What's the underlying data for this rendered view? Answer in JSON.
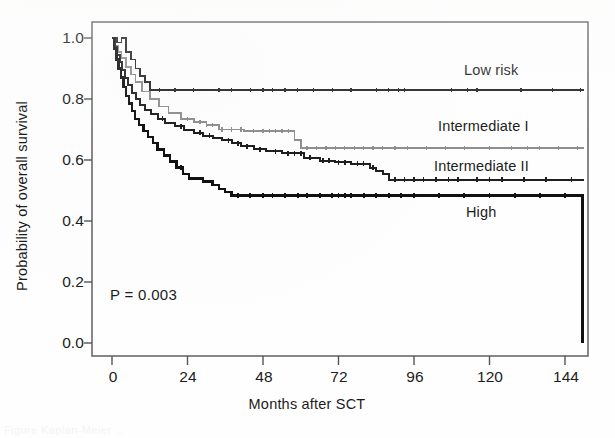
{
  "figure": {
    "kind": "kaplan-meier-survival-plot",
    "caption_remnant": "Figure  Kaplan-Meier ..."
  },
  "axes": {
    "y_title": "Probability of overall survival",
    "x_title": "Months after SCT",
    "y_ticks": [
      "0.0",
      "0.2",
      "0.4",
      "0.6",
      "0.8",
      "1.0"
    ],
    "x_ticks": [
      "0",
      "24",
      "48",
      "72",
      "96",
      "120",
      "144"
    ]
  },
  "annotations": {
    "pvalue": "P = 0.003"
  },
  "curve_labels": {
    "low": "Low risk",
    "intermediate_1": "Intermediate I",
    "intermediate_2": "Intermediate II",
    "high": "High"
  },
  "colors": {
    "low_risk": "#262626",
    "intermediate_1": "#8f8f8f",
    "intermediate_2": "#1f1f1f",
    "high": "#111111",
    "frame": "#555555",
    "text": "#1c1c1c",
    "background": "#fefefe"
  },
  "chart_data": {
    "type": "line",
    "plot_kind": "kaplan-meier step survival curves",
    "title": "",
    "xlabel": "Months after SCT",
    "ylabel": "Probability of overall survival",
    "xlim": [
      -4,
      152
    ],
    "ylim": [
      0.0,
      1.04
    ],
    "xticks": [
      0,
      24,
      48,
      72,
      96,
      120,
      144
    ],
    "yticks": [
      0.0,
      0.2,
      0.4,
      0.6,
      0.8,
      1.0
    ],
    "grid": false,
    "legend": "inline labels at right end of each curve",
    "annotations": [
      {
        "text": "P = 0.003",
        "x": 6,
        "y": 0.19
      }
    ],
    "series": [
      {
        "name": "Low risk",
        "color": "#262626",
        "plateau_value": 0.83,
        "final_value": 0.83,
        "steps": [
          [
            0,
            1.0
          ],
          [
            1.5,
            1.0
          ],
          [
            1.5,
            0.985
          ],
          [
            3.0,
            0.985
          ],
          [
            3.0,
            1.0
          ],
          [
            4.5,
            1.0
          ],
          [
            4.5,
            0.955
          ],
          [
            6.0,
            0.955
          ],
          [
            6.0,
            0.93
          ],
          [
            7.5,
            0.93
          ],
          [
            7.5,
            0.9
          ],
          [
            9.0,
            0.9
          ],
          [
            9.0,
            0.875
          ],
          [
            10.5,
            0.875
          ],
          [
            10.5,
            0.855
          ],
          [
            12.0,
            0.855
          ],
          [
            12.0,
            0.83
          ],
          [
            150,
            0.83
          ]
        ],
        "censor_months": [
          15,
          20,
          26,
          34,
          38,
          44,
          48,
          51,
          55,
          59,
          64,
          70,
          76,
          84,
          88,
          91,
          93,
          108,
          113,
          116,
          130,
          140,
          149
        ]
      },
      {
        "name": "Intermediate I",
        "color": "#8f8f8f",
        "plateau_value": 0.64,
        "final_value": 0.64,
        "steps": [
          [
            0,
            1.0
          ],
          [
            1.0,
            1.0
          ],
          [
            1.0,
            0.975
          ],
          [
            2.0,
            0.975
          ],
          [
            2.0,
            0.955
          ],
          [
            3.0,
            0.955
          ],
          [
            3.0,
            0.935
          ],
          [
            4.5,
            0.935
          ],
          [
            4.5,
            0.905
          ],
          [
            6.0,
            0.905
          ],
          [
            6.0,
            0.88
          ],
          [
            7.5,
            0.88
          ],
          [
            7.5,
            0.855
          ],
          [
            9.5,
            0.855
          ],
          [
            9.5,
            0.825
          ],
          [
            12.0,
            0.825
          ],
          [
            12.0,
            0.8
          ],
          [
            15.0,
            0.8
          ],
          [
            15.0,
            0.775
          ],
          [
            18.0,
            0.775
          ],
          [
            18.0,
            0.755
          ],
          [
            22.0,
            0.755
          ],
          [
            22.0,
            0.735
          ],
          [
            26.0,
            0.735
          ],
          [
            26.0,
            0.725
          ],
          [
            30.0,
            0.725
          ],
          [
            30.0,
            0.715
          ],
          [
            34.0,
            0.715
          ],
          [
            34.0,
            0.7
          ],
          [
            42.0,
            0.7
          ],
          [
            42.0,
            0.695
          ],
          [
            58.0,
            0.695
          ],
          [
            58.0,
            0.665
          ],
          [
            60.0,
            0.665
          ],
          [
            60.0,
            0.64
          ],
          [
            150,
            0.64
          ]
        ],
        "censor_months": [
          24,
          28,
          30,
          32,
          35,
          38,
          41,
          45,
          48,
          50,
          52,
          54,
          56,
          62,
          65,
          68,
          71,
          74,
          77,
          80,
          83,
          86,
          90,
          94,
          100,
          106,
          112,
          120,
          127,
          132,
          136,
          142,
          148
        ]
      },
      {
        "name": "Intermediate II",
        "color": "#1f1f1f",
        "plateau_value": 0.535,
        "final_value": 0.535,
        "steps": [
          [
            0,
            1.0
          ],
          [
            0.8,
            1.0
          ],
          [
            0.8,
            0.97
          ],
          [
            1.6,
            0.97
          ],
          [
            1.6,
            0.945
          ],
          [
            2.4,
            0.945
          ],
          [
            2.4,
            0.92
          ],
          [
            3.2,
            0.92
          ],
          [
            3.2,
            0.895
          ],
          [
            4.2,
            0.895
          ],
          [
            4.2,
            0.87
          ],
          [
            5.2,
            0.87
          ],
          [
            5.2,
            0.845
          ],
          [
            6.4,
            0.845
          ],
          [
            6.4,
            0.82
          ],
          [
            7.6,
            0.82
          ],
          [
            7.6,
            0.8
          ],
          [
            9.0,
            0.8
          ],
          [
            9.0,
            0.78
          ],
          [
            10.5,
            0.78
          ],
          [
            10.5,
            0.765
          ],
          [
            12.5,
            0.765
          ],
          [
            12.5,
            0.75
          ],
          [
            14.5,
            0.75
          ],
          [
            14.5,
            0.735
          ],
          [
            17.0,
            0.735
          ],
          [
            17.0,
            0.72
          ],
          [
            20.0,
            0.72
          ],
          [
            20.0,
            0.71
          ],
          [
            23.0,
            0.71
          ],
          [
            23.0,
            0.7
          ],
          [
            26.0,
            0.7
          ],
          [
            26.0,
            0.69
          ],
          [
            29.0,
            0.69
          ],
          [
            29.0,
            0.68
          ],
          [
            32.0,
            0.68
          ],
          [
            32.0,
            0.672
          ],
          [
            35.0,
            0.672
          ],
          [
            35.0,
            0.665
          ],
          [
            38.0,
            0.665
          ],
          [
            38.0,
            0.655
          ],
          [
            41.0,
            0.655
          ],
          [
            41.0,
            0.645
          ],
          [
            45.0,
            0.645
          ],
          [
            45.0,
            0.635
          ],
          [
            49.0,
            0.635
          ],
          [
            49.0,
            0.628
          ],
          [
            54.0,
            0.628
          ],
          [
            54.0,
            0.622
          ],
          [
            61.0,
            0.622
          ],
          [
            61.0,
            0.608
          ],
          [
            66.0,
            0.608
          ],
          [
            66.0,
            0.598
          ],
          [
            71.0,
            0.598
          ],
          [
            71.0,
            0.592
          ],
          [
            76.0,
            0.592
          ],
          [
            76.0,
            0.588
          ],
          [
            82.0,
            0.588
          ],
          [
            82.0,
            0.575
          ],
          [
            84.0,
            0.575
          ],
          [
            84.0,
            0.565
          ],
          [
            86.0,
            0.565
          ],
          [
            86.0,
            0.555
          ],
          [
            88.0,
            0.555
          ],
          [
            88.0,
            0.535
          ],
          [
            150,
            0.535
          ]
        ],
        "censor_months": [
          16,
          22,
          28,
          31,
          37,
          40,
          43,
          47,
          52,
          56,
          58,
          60,
          63,
          67,
          69,
          72,
          74,
          78,
          80,
          83,
          90,
          93,
          96,
          99,
          103,
          107,
          110,
          116,
          120,
          124,
          131,
          138,
          146
        ]
      },
      {
        "name": "High",
        "color": "#111111",
        "plateau_value": 0.483,
        "final_value": 0.0,
        "steps": [
          [
            0,
            1.0
          ],
          [
            0.7,
            1.0
          ],
          [
            0.7,
            0.965
          ],
          [
            1.4,
            0.965
          ],
          [
            1.4,
            0.93
          ],
          [
            2.1,
            0.93
          ],
          [
            2.1,
            0.9
          ],
          [
            2.8,
            0.9
          ],
          [
            2.8,
            0.87
          ],
          [
            3.6,
            0.87
          ],
          [
            3.6,
            0.84
          ],
          [
            4.4,
            0.84
          ],
          [
            4.4,
            0.81
          ],
          [
            5.4,
            0.81
          ],
          [
            5.4,
            0.785
          ],
          [
            6.4,
            0.785
          ],
          [
            6.4,
            0.76
          ],
          [
            7.4,
            0.76
          ],
          [
            7.4,
            0.735
          ],
          [
            8.6,
            0.735
          ],
          [
            8.6,
            0.715
          ],
          [
            10.0,
            0.715
          ],
          [
            10.0,
            0.695
          ],
          [
            11.5,
            0.695
          ],
          [
            11.5,
            0.675
          ],
          [
            13.0,
            0.675
          ],
          [
            13.0,
            0.655
          ],
          [
            14.5,
            0.655
          ],
          [
            14.5,
            0.635
          ],
          [
            16.5,
            0.635
          ],
          [
            16.5,
            0.615
          ],
          [
            18.5,
            0.615
          ],
          [
            18.5,
            0.595
          ],
          [
            20.5,
            0.595
          ],
          [
            20.5,
            0.575
          ],
          [
            22.5,
            0.575
          ],
          [
            22.5,
            0.555
          ],
          [
            24.5,
            0.555
          ],
          [
            24.5,
            0.54
          ],
          [
            29.0,
            0.54
          ],
          [
            29.0,
            0.53
          ],
          [
            32.0,
            0.53
          ],
          [
            32.0,
            0.518
          ],
          [
            34.0,
            0.518
          ],
          [
            34.0,
            0.505
          ],
          [
            36.0,
            0.505
          ],
          [
            36.0,
            0.495
          ],
          [
            38.0,
            0.495
          ],
          [
            38.0,
            0.483
          ],
          [
            149.5,
            0.483
          ],
          [
            149.5,
            0.0
          ]
        ],
        "censor_months": [
          22,
          40,
          44,
          48,
          51,
          55,
          59,
          62,
          66,
          70,
          72,
          74,
          76,
          80,
          84,
          88,
          92,
          96,
          104,
          112,
          120,
          128,
          136,
          144
        ]
      }
    ]
  },
  "geometry": {
    "plot_left_px": 92,
    "plot_right_px": 588,
    "plot_top_px": 22,
    "plot_bottom_px": 356,
    "y_value_at_top_px": 38,
    "y_value_at_bottom_px": 343,
    "x_value_0_px": 112,
    "x_value_144_px": 565
  }
}
